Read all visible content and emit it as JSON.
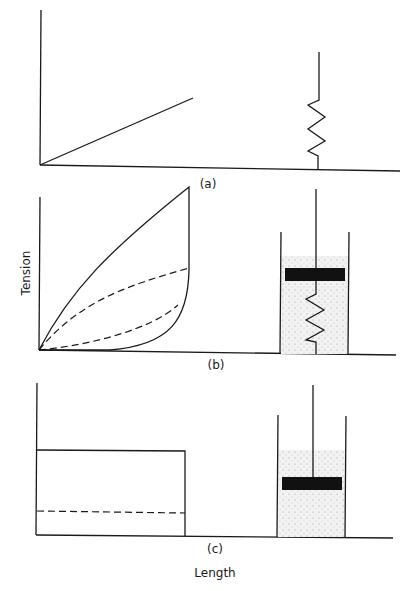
{
  "figure": {
    "panels": [
      {
        "id": "a",
        "label": "(a)",
        "model": "spring",
        "curve": "linear"
      },
      {
        "id": "b",
        "label": "(b)",
        "model": "spring-in-dashpot",
        "curve": "hysteresis loop"
      },
      {
        "id": "c",
        "label": "(c)",
        "model": "dashpot",
        "curve": "rectangular"
      }
    ],
    "ylabel": "Tension",
    "xlabel": "Length"
  },
  "colors": {
    "line": "#1a1a1a",
    "fluid": "#ececec",
    "piston": "#111111"
  }
}
